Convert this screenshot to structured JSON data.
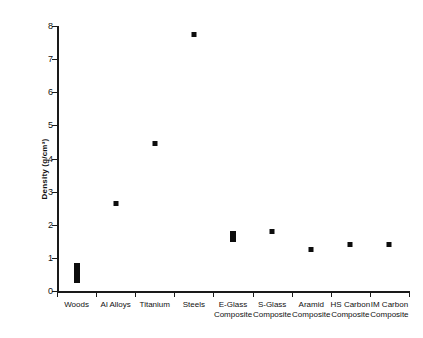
{
  "chart_data": {
    "type": "scatter",
    "title": "",
    "xlabel": "",
    "ylabel": "Density (g/cm³)",
    "ylim": [
      0,
      8
    ],
    "yticks": [
      0,
      1,
      2,
      3,
      4,
      5,
      6,
      7,
      8
    ],
    "ytick_labels": [
      "0",
      "1",
      "2",
      "3",
      "4",
      "5",
      "6",
      "7",
      "8"
    ],
    "grid": false,
    "legend": null,
    "categories": [
      "Woods",
      "Al Alloys",
      "Titanium",
      "Steels",
      "E-Glass Composite",
      "S-Glass Composite",
      "Aramid Composite",
      "HS Carbon Composite",
      "IM Carbon Composite"
    ],
    "category_lines": [
      [
        "Woods",
        ""
      ],
      [
        "Al Alloys",
        ""
      ],
      [
        "Titanium",
        ""
      ],
      [
        "Steels",
        ""
      ],
      [
        "E-Glass",
        "Composite"
      ],
      [
        "S-Glass",
        "Composite"
      ],
      [
        "Aramid",
        "Composite"
      ],
      [
        "HS Carbon",
        "Composite"
      ],
      [
        "IM Carbon",
        "Composite"
      ]
    ],
    "points": [
      {
        "category": "Woods",
        "kind": "range",
        "low": 0.25,
        "high": 0.85,
        "value": 0.55
      },
      {
        "category": "Al Alloys",
        "kind": "point",
        "low": 2.65,
        "high": 2.65,
        "value": 2.65
      },
      {
        "category": "Titanium",
        "kind": "point",
        "low": 4.45,
        "high": 4.45,
        "value": 4.45
      },
      {
        "category": "Steels",
        "kind": "point",
        "low": 7.75,
        "high": 7.75,
        "value": 7.75
      },
      {
        "category": "E-Glass Composite",
        "kind": "range",
        "low": 1.48,
        "high": 1.82,
        "value": 1.65
      },
      {
        "category": "S-Glass Composite",
        "kind": "point",
        "low": 1.8,
        "high": 1.8,
        "value": 1.8
      },
      {
        "category": "Aramid Composite",
        "kind": "point",
        "low": 1.25,
        "high": 1.25,
        "value": 1.25
      },
      {
        "category": "HS Carbon Composite",
        "kind": "point",
        "low": 1.4,
        "high": 1.4,
        "value": 1.4
      },
      {
        "category": "IM Carbon Composite",
        "kind": "point",
        "low": 1.4,
        "high": 1.4,
        "value": 1.4
      }
    ],
    "values": [
      0.55,
      2.65,
      4.45,
      7.75,
      1.65,
      1.8,
      1.25,
      1.4,
      1.4
    ],
    "marker_color": "#0d0d0d",
    "axis_color": "#1a1a1a"
  },
  "caption": {
    "text": ""
  }
}
